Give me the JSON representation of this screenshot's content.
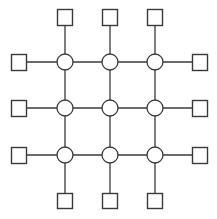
{
  "diagram": {
    "type": "grid-network",
    "colors": {
      "stroke": "#3a3a3a",
      "fill": "#ffffff",
      "background": "#ffffff"
    },
    "grid": {
      "columns_x": [
        65,
        110,
        155
      ],
      "rows_y": [
        62,
        108,
        155
      ],
      "circle_radius": 8
    },
    "square_size": 15,
    "terminals": {
      "top": {
        "y": 17,
        "x": [
          65,
          110,
          155
        ]
      },
      "bottom": {
        "y": 201,
        "x": [
          65,
          110,
          155
        ]
      },
      "left": {
        "x": 19,
        "y": [
          62,
          108,
          155
        ]
      },
      "right": {
        "x": 200,
        "y": [
          62,
          108,
          155
        ]
      }
    },
    "node_count": {
      "circles": 9,
      "squares": 12
    }
  }
}
